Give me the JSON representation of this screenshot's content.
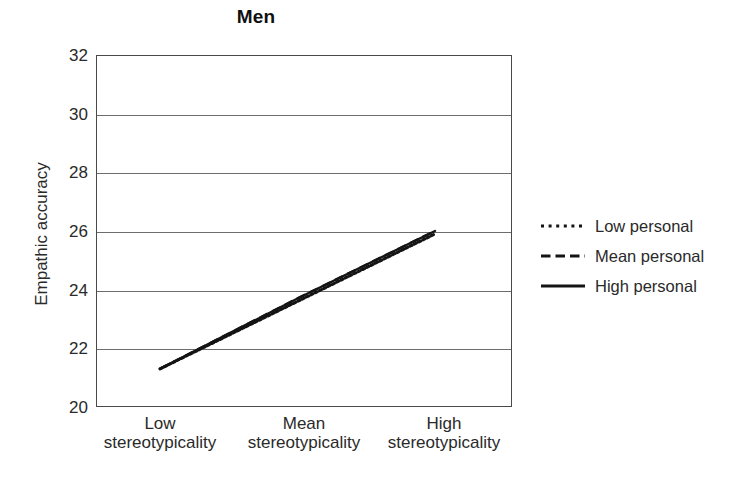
{
  "chart_data": {
    "type": "line",
    "title": "Men",
    "xlabel": "",
    "ylabel": "Empathic accuracy",
    "categories": [
      "Low stereotypicality",
      "Mean stereotypicality",
      "High stereotypicality"
    ],
    "category_lines": [
      {
        "l1": "Low",
        "l2": "stereotypicality"
      },
      {
        "l1": "Mean",
        "l2": "stereotypicality"
      },
      {
        "l1": "High",
        "l2": "stereotypicality"
      }
    ],
    "ylim": [
      20,
      32
    ],
    "yticks": [
      32,
      30,
      28,
      26,
      24,
      22,
      20
    ],
    "ytick_labels": [
      "32",
      "30",
      "28",
      "26",
      "24",
      "22",
      "20"
    ],
    "grid": true,
    "grid_axis": "y",
    "legend_position": "right",
    "series": [
      {
        "name": "Low personal",
        "style": "dotted",
        "values": [
          21.3,
          23.6,
          25.9
        ],
        "color": "#141414"
      },
      {
        "name": "Mean personal",
        "style": "dashed",
        "values": [
          21.3,
          23.7,
          26.0
        ],
        "color": "#141414"
      },
      {
        "name": "High personal",
        "style": "solid",
        "values": [
          21.3,
          23.7,
          26.0
        ],
        "color": "#141414"
      }
    ],
    "annotations": []
  },
  "legend": {
    "items": [
      {
        "label": "Low personal",
        "style": "dotted"
      },
      {
        "label": "Mean personal",
        "style": "dashed"
      },
      {
        "label": "High personal",
        "style": "solid"
      }
    ]
  },
  "colors": {
    "axis": "#4a4a4a",
    "grid": "#6d6d6d",
    "line": "#141414",
    "text": "#2a2a2a",
    "background": "#ffffff"
  }
}
